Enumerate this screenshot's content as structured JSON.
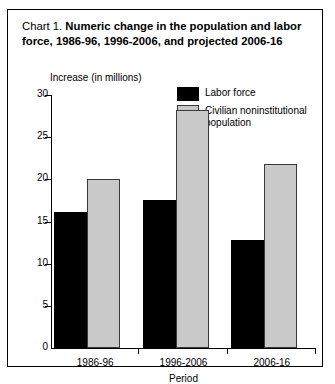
{
  "chart_data": {
    "type": "bar",
    "title_prefix": "Chart 1.",
    "title": "Numeric change in the population and labor force, 1986-96, 1996-2006, and projected 2006-16",
    "title_line1": "Numeric change in the population and",
    "title_line2": "labor force, 1986-96, 1996-2006, and projected",
    "title_line3": "2006-16",
    "ylabel": "Increase (in millions)",
    "xlabel": "Period",
    "categories": [
      "1986-96",
      "1996-2006",
      "2006-16"
    ],
    "yticks": [
      "30",
      "25",
      "20",
      "15",
      "10",
      "5",
      "0"
    ],
    "ytick_values": [
      30,
      25,
      20,
      15,
      10,
      5,
      0
    ],
    "ylim": [
      0,
      30
    ],
    "grid": false,
    "legend_position": "top-right",
    "series": [
      {
        "name": "Labor force",
        "color": "#000000",
        "values": [
          16.1,
          17.5,
          12.8
        ]
      },
      {
        "name": "Civilian noninstitutional population",
        "name_line1": "Civilian noninstitutional",
        "name_line2": "population",
        "color": "#c9c9c9",
        "values": [
          20.1,
          28.2,
          21.8
        ]
      }
    ]
  }
}
